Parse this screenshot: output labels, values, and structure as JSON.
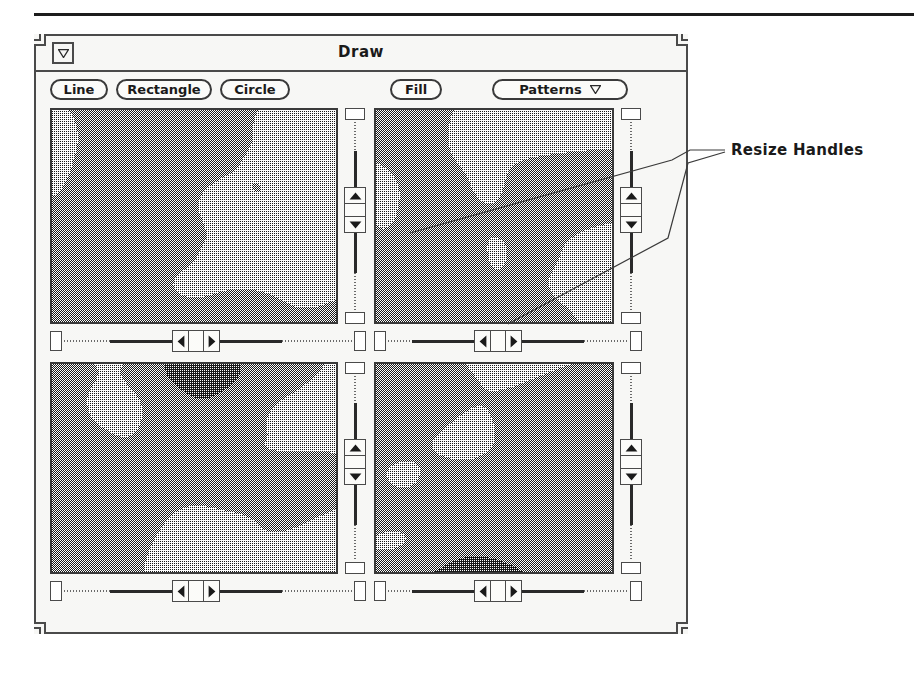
{
  "figure": {
    "annotation_label": "Resize Handles",
    "rule_color": "#1c1c1c"
  },
  "window": {
    "title": "Draw",
    "menu_icon": "window-menu-triangle-icon",
    "frame_color": "#4a4a4a",
    "background": "#f7f7f5",
    "corners": [
      "top-left-resize-handle",
      "top-right-resize-handle",
      "bottom-left-resize-handle",
      "bottom-right-resize-handle"
    ]
  },
  "toolbar": {
    "buttons": [
      {
        "label": "Line",
        "name": "line-button",
        "x": 14,
        "width": 58
      },
      {
        "label": "Rectangle",
        "name": "rectangle-button",
        "x": 80,
        "width": 96
      },
      {
        "label": "Circle",
        "name": "circle-button",
        "x": 184,
        "width": 70
      },
      {
        "label": "Fill",
        "name": "fill-button",
        "x": 354,
        "width": 52
      }
    ],
    "dropdown": {
      "label": "Patterns",
      "name": "patterns-dropdown",
      "arrow_icon": "chevron-down-icon",
      "x": 456,
      "width": 136
    }
  },
  "panes": [
    {
      "name": "image-pane-top-left",
      "seed": 11,
      "x": 14,
      "y": 72,
      "width": 288,
      "height": 216,
      "vscroll": {
        "name": "vscrollbar-top-left",
        "thumb_pos": 0.46
      },
      "hscroll": {
        "name": "hscrollbar-top-left",
        "thumb_pos": 0.45
      }
    },
    {
      "name": "image-pane-top-right",
      "seed": 27,
      "x": 338,
      "y": 72,
      "width": 240,
      "height": 216,
      "vscroll": {
        "name": "vscrollbar-top-right",
        "thumb_pos": 0.46
      },
      "hscroll": {
        "name": "hscrollbar-top-right",
        "thumb_pos": 0.45
      }
    },
    {
      "name": "image-pane-bottom-left",
      "seed": 43,
      "x": 14,
      "y": 326,
      "width": 288,
      "height": 212,
      "vscroll": {
        "name": "vscrollbar-bottom-left",
        "thumb_pos": 0.46
      },
      "hscroll": {
        "name": "hscrollbar-bottom-left",
        "thumb_pos": 0.45
      }
    },
    {
      "name": "image-pane-bottom-right",
      "seed": 59,
      "x": 338,
      "y": 326,
      "width": 240,
      "height": 212,
      "vscroll": {
        "name": "vscrollbar-bottom-right",
        "thumb_pos": 0.46
      },
      "hscroll": {
        "name": "hscrollbar-bottom-right",
        "thumb_pos": 0.45
      }
    }
  ],
  "scrollbar_icons": {
    "up": "triangle-up-icon",
    "down": "triangle-down-icon",
    "left": "triangle-left-icon",
    "right": "triangle-right-icon"
  }
}
